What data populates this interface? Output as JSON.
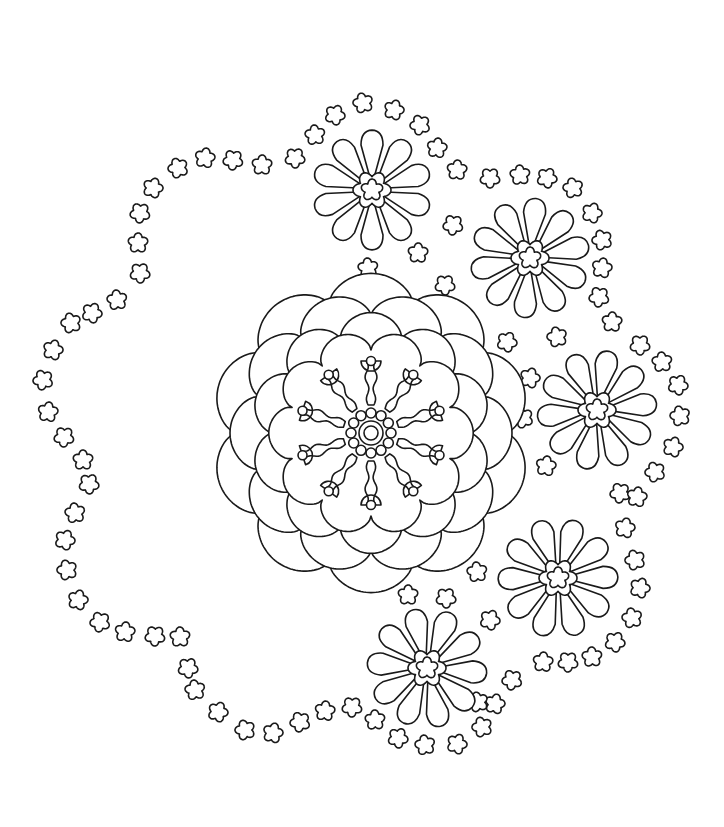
{
  "colors": {
    "line": "#1a1a1a",
    "background": "#ffffff"
  },
  "mandala": {
    "center": [
      371,
      433
    ],
    "scallop_layers": [
      {
        "r": 150,
        "amp": 16,
        "lobes": 10,
        "rot": 0
      },
      {
        "r": 132,
        "amp": 15,
        "lobes": 10,
        "rot": 18
      },
      {
        "r": 112,
        "amp": 14,
        "lobes": 10,
        "rot": 0
      },
      {
        "r": 95,
        "amp": 12,
        "lobes": 10,
        "rot": 18
      }
    ],
    "rays": {
      "count": 10,
      "inner": 28,
      "outer": 82,
      "width": 7,
      "bulb": 10
    },
    "dot_ring": {
      "count": 12,
      "radius": 20,
      "dot_r": 5
    },
    "core_circles": [
      12,
      7
    ]
  },
  "daisies": [
    {
      "c": [
        372,
        190
      ],
      "petal": 56,
      "petals": 10
    },
    {
      "c": [
        530,
        258
      ],
      "petal": 56,
      "petals": 10
    },
    {
      "c": [
        597,
        410
      ],
      "petal": 56,
      "petals": 10
    },
    {
      "c": [
        558,
        578
      ],
      "petal": 56,
      "petals": 10
    },
    {
      "c": [
        427,
        668
      ],
      "petal": 56,
      "petals": 10
    }
  ],
  "small_flowers": [
    [
      153,
      188
    ],
    [
      178,
      168
    ],
    [
      205,
      158
    ],
    [
      233,
      160
    ],
    [
      262,
      165
    ],
    [
      295,
      158
    ],
    [
      315,
      135
    ],
    [
      335,
      115
    ],
    [
      363,
      103
    ],
    [
      394,
      110
    ],
    [
      420,
      125
    ],
    [
      437,
      148
    ],
    [
      140,
      213
    ],
    [
      138,
      243
    ],
    [
      140,
      273
    ],
    [
      117,
      300
    ],
    [
      92,
      313
    ],
    [
      71,
      323
    ],
    [
      53,
      350
    ],
    [
      43,
      380
    ],
    [
      48,
      412
    ],
    [
      64,
      437
    ],
    [
      83,
      460
    ],
    [
      89,
      484
    ],
    [
      75,
      513
    ],
    [
      65,
      540
    ],
    [
      67,
      570
    ],
    [
      78,
      600
    ],
    [
      100,
      622
    ],
    [
      125,
      632
    ],
    [
      155,
      636
    ],
    [
      180,
      637
    ],
    [
      188,
      668
    ],
    [
      195,
      690
    ],
    [
      218,
      712
    ],
    [
      245,
      730
    ],
    [
      273,
      733
    ],
    [
      300,
      722
    ],
    [
      325,
      711
    ],
    [
      352,
      707
    ],
    [
      375,
      720
    ],
    [
      398,
      738
    ],
    [
      425,
      745
    ],
    [
      457,
      744
    ],
    [
      482,
      727
    ],
    [
      495,
      704
    ],
    [
      512,
      680
    ],
    [
      543,
      662
    ],
    [
      568,
      662
    ],
    [
      592,
      657
    ],
    [
      615,
      642
    ],
    [
      632,
      618
    ],
    [
      640,
      588
    ],
    [
      635,
      560
    ],
    [
      625,
      528
    ],
    [
      620,
      493
    ],
    [
      457,
      170
    ],
    [
      490,
      178
    ],
    [
      520,
      175
    ],
    [
      547,
      178
    ],
    [
      573,
      188
    ],
    [
      592,
      213
    ],
    [
      602,
      240
    ],
    [
      602,
      268
    ],
    [
      599,
      297
    ],
    [
      612,
      322
    ],
    [
      640,
      345
    ],
    [
      662,
      362
    ],
    [
      678,
      385
    ],
    [
      680,
      416
    ],
    [
      673,
      447
    ],
    [
      655,
      472
    ],
    [
      637,
      497
    ],
    [
      453,
      225
    ],
    [
      418,
      253
    ],
    [
      445,
      285
    ],
    [
      368,
      268
    ],
    [
      507,
      342
    ],
    [
      557,
      337
    ],
    [
      530,
      378
    ],
    [
      523,
      418
    ],
    [
      546,
      466
    ],
    [
      502,
      497
    ],
    [
      408,
      595
    ],
    [
      446,
      598
    ],
    [
      477,
      572
    ],
    [
      490,
      620
    ],
    [
      478,
      702
    ]
  ],
  "small_flower_size": 10
}
